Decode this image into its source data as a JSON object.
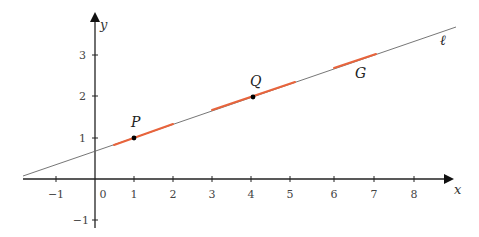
{
  "diagram": {
    "axes": {
      "x_label": "x",
      "y_label": "y",
      "x_ticks": [
        {
          "value": -1,
          "label": "−1"
        },
        {
          "value": 1,
          "label": "1"
        },
        {
          "value": 2,
          "label": "2"
        },
        {
          "value": 3,
          "label": "3"
        },
        {
          "value": 4,
          "label": "4"
        },
        {
          "value": 5,
          "label": "5"
        },
        {
          "value": 6,
          "label": "6"
        },
        {
          "value": 7,
          "label": "7"
        },
        {
          "value": 8,
          "label": "8"
        }
      ],
      "y_ticks": [
        {
          "value": 3,
          "label": "3"
        },
        {
          "value": 2,
          "label": "2"
        },
        {
          "value": 1,
          "label": "1"
        },
        {
          "value": -1,
          "label": "−1"
        }
      ],
      "origin_label": "0"
    },
    "line": {
      "label": "ℓ",
      "equation": "y = x/3 + 2/3",
      "color": "#555555"
    },
    "points": [
      {
        "name": "P",
        "x": 1,
        "y": 1
      },
      {
        "name": "Q",
        "x": 4,
        "y": 2
      }
    ],
    "segment_label": "G",
    "highlight_color": "#e8643c",
    "highlight_segments": [
      {
        "from_x": 0.5,
        "to_x": 2
      },
      {
        "from_x": 3,
        "to_x": 5.1
      },
      {
        "from_x": 6.1,
        "to_x": 7.1
      }
    ]
  }
}
